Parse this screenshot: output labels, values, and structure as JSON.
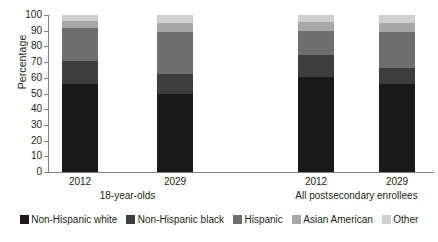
{
  "chart_data": {
    "type": "bar",
    "subtype": "stacked-percentage",
    "title": "",
    "xlabel": "",
    "ylabel": "Percentage",
    "ylim": [
      0,
      100
    ],
    "yticks": [
      0,
      10,
      20,
      30,
      40,
      50,
      60,
      70,
      80,
      90,
      100
    ],
    "grid": false,
    "legend_position": "bottom",
    "categories": [
      "2012",
      "2029",
      "2012",
      "2029"
    ],
    "groups": [
      {
        "label": "18-year-olds",
        "categories": [
          "2012",
          "2029"
        ]
      },
      {
        "label": "All postsecondary enrollees",
        "categories": [
          "2012",
          "2029"
        ]
      }
    ],
    "series": [
      {
        "name": "Non-Hispanic white",
        "color": "#1a1a1a",
        "values": [
          56,
          50,
          60.5,
          56
        ]
      },
      {
        "name": "Non-Hispanic black",
        "color": "#3d3d3d",
        "values": [
          14.5,
          12.5,
          14,
          10
        ]
      },
      {
        "name": "Hispanic",
        "color": "#6e6e6e",
        "values": [
          21.5,
          27,
          15.5,
          23
        ]
      },
      {
        "name": "Asian American",
        "color": "#a7a7a7",
        "values": [
          4,
          5.5,
          5.5,
          6
        ]
      },
      {
        "name": "Other",
        "color": "#cfcfcf",
        "values": [
          4,
          5,
          4.5,
          5
        ]
      }
    ],
    "bars": [
      {
        "group": "18-year-olds",
        "category": "2012",
        "cumulative": [
          56,
          70.5,
          92,
          96,
          100
        ]
      },
      {
        "group": "18-year-olds",
        "category": "2029",
        "cumulative": [
          50,
          62.5,
          89.5,
          95,
          100
        ]
      },
      {
        "group": "All postsecondary enrollees",
        "category": "2012",
        "cumulative": [
          60.5,
          74.5,
          90,
          95.5,
          100
        ]
      },
      {
        "group": "All postsecondary enrollees",
        "category": "2029",
        "cumulative": [
          56,
          66,
          89,
          95,
          100
        ]
      }
    ]
  },
  "axis": {
    "y_title": "Percentage",
    "y_tick_labels": [
      "0",
      "10",
      "20",
      "30",
      "40",
      "50",
      "60",
      "70",
      "80",
      "90",
      "100"
    ],
    "x_tick_labels": [
      "2012",
      "2029",
      "2012",
      "2029"
    ],
    "group_labels": [
      "18-year-olds",
      "All postsecondary enrollees"
    ]
  },
  "legend": {
    "items": [
      {
        "label": "Non-Hispanic white",
        "color": "#1a1a1a"
      },
      {
        "label": "Non-Hispanic black",
        "color": "#3d3d3d"
      },
      {
        "label": "Hispanic",
        "color": "#6e6e6e"
      },
      {
        "label": "Asian American",
        "color": "#a7a7a7"
      },
      {
        "label": "Other",
        "color": "#cfcfcf"
      }
    ]
  },
  "colors": {
    "axis": "#808285",
    "text": "#231f20",
    "background": "#ffffff"
  }
}
